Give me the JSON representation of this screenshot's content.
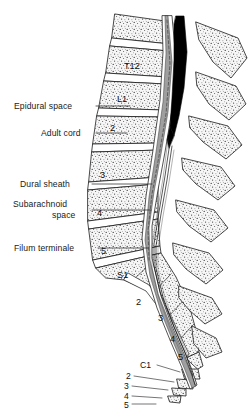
{
  "figure": {
    "background_color": "#ffffff",
    "ink_color": "#1a1a1a",
    "cord_color": "#000000",
    "dura_color": "#8c8c8c",
    "bone_fill": "#f2f2f2"
  },
  "callouts": [
    {
      "id": "epidural-space",
      "label": "Epidural space",
      "x": 14,
      "y": 101,
      "line_x1": 96,
      "line_y1": 106,
      "line_x2": 130,
      "line_y2": 106
    },
    {
      "id": "adult-cord",
      "label": "Adult cord",
      "x": 41,
      "y": 128,
      "line_x1": 96,
      "line_y1": 133,
      "line_x2": 127,
      "line_y2": 133
    },
    {
      "id": "dural-sheath",
      "label": "Dural sheath",
      "x": 20,
      "y": 179,
      "line_x1": 92,
      "line_y1": 184,
      "line_x2": 152,
      "line_y2": 184
    },
    {
      "id": "subarachnoid-space",
      "label": "Subarachnoid",
      "label2": "space",
      "x": 13,
      "y": 199,
      "line_x1": 92,
      "line_y1": 210,
      "line_x2": 151,
      "line_y2": 210
    },
    {
      "id": "filum-terminale",
      "label": "Filum terminale",
      "x": 14,
      "y": 243,
      "line_x1": 98,
      "line_y1": 248,
      "line_x2": 148,
      "line_y2": 248
    }
  ],
  "vertebrae": [
    {
      "id": "t12",
      "label": "T12",
      "x": 124,
      "y": 61
    },
    {
      "id": "l1",
      "label": "L1",
      "x": 117,
      "y": 94
    },
    {
      "id": "l2",
      "label": "2",
      "x": 110,
      "y": 123
    },
    {
      "id": "l3",
      "label": "3",
      "x": 100,
      "y": 170
    },
    {
      "id": "l4",
      "label": "4",
      "x": 97,
      "y": 208
    },
    {
      "id": "l5",
      "label": "5",
      "x": 101,
      "y": 246
    },
    {
      "id": "s1",
      "label": "S1",
      "x": 117,
      "y": 270
    },
    {
      "id": "s2",
      "label": "2",
      "x": 136,
      "y": 297
    },
    {
      "id": "s3",
      "label": "3",
      "x": 158,
      "y": 313
    },
    {
      "id": "s4",
      "label": "4",
      "x": 170,
      "y": 334
    },
    {
      "id": "s5",
      "label": "5",
      "x": 178,
      "y": 352
    }
  ],
  "coccyx": [
    {
      "id": "c1",
      "label": "C1",
      "x": 140,
      "y": 360,
      "line_x1": 157,
      "line_y1": 365,
      "line_x2": 176,
      "line_y2": 371
    },
    {
      "id": "c2",
      "label": "2",
      "x": 126,
      "y": 371,
      "line_x1": 134,
      "line_y1": 376,
      "line_x2": 172,
      "line_y2": 381
    },
    {
      "id": "c3",
      "label": "3",
      "x": 124,
      "y": 381,
      "line_x1": 132,
      "line_y1": 386,
      "line_x2": 166,
      "line_y2": 390
    },
    {
      "id": "c4",
      "label": "4",
      "x": 124,
      "y": 391,
      "line_x1": 132,
      "line_y1": 396,
      "line_x2": 160,
      "line_y2": 398
    },
    {
      "id": "c5",
      "label": "5",
      "x": 124,
      "y": 400,
      "line_x1": 132,
      "line_y1": 404,
      "line_x2": 154,
      "line_y2": 404
    }
  ]
}
